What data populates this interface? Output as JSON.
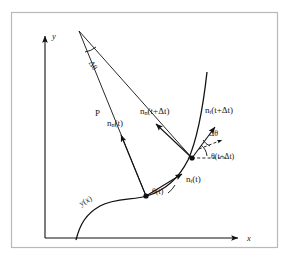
{
  "figure": {
    "type": "geometry-diagram",
    "background_color": "#ffffff",
    "ink_color": "#111111",
    "frame_color": "#b9b9bd"
  },
  "axes": {
    "x_label": "x",
    "y_label": "y",
    "origin": {
      "x": 45,
      "y": 238
    },
    "x_end": {
      "x": 243,
      "y": 238
    },
    "y_end": {
      "x": 45,
      "y": 32
    }
  },
  "curve": {
    "label": "y(x)",
    "label_rotation_deg": -30,
    "label_position": {
      "x": 80,
      "y": 205
    },
    "path": "M 76,240 C 80,224 86,214 100,206 C 114,198 134,200 147,196 C 163,191 178,180 188,160 C 198,138 203,108 207,72"
  },
  "points": [
    {
      "name": "point-t",
      "x": 146,
      "y": 196
    },
    {
      "name": "point-t-plus-dt",
      "x": 192,
      "y": 158
    }
  ],
  "vectors": [
    {
      "name": "normal-t",
      "label": "n",
      "subscript": "n",
      "argument": "(t)",
      "label_position": {
        "x": 113,
        "y": 123
      },
      "from": {
        "x": 146,
        "y": 196
      },
      "to": {
        "x": 119,
        "y": 133
      }
    },
    {
      "name": "normal-t-plus-dt",
      "label": "n",
      "subscript": "n",
      "argument": "(t+Δt)",
      "label_position": {
        "x": 148,
        "y": 110
      },
      "from": {
        "x": 192,
        "y": 158
      },
      "to": {
        "x": 154,
        "y": 122
      }
    },
    {
      "name": "tangent-t",
      "label": "n",
      "subscript": "t",
      "argument": "(t)",
      "label_position": {
        "x": 190,
        "y": 180
      },
      "from": {
        "x": 146,
        "y": 196
      },
      "to": {
        "x": 184,
        "y": 173
      }
    },
    {
      "name": "tangent-t-plus-dt",
      "label": "n",
      "subscript": "t",
      "argument": "(t+Δt)",
      "label_position": {
        "x": 212,
        "y": 110
      },
      "from": {
        "x": 192,
        "y": 158
      },
      "to": {
        "x": 217,
        "y": 125
      }
    }
  ],
  "angles": [
    {
      "name": "delta-theta-apex",
      "label": "Δθ",
      "rotation_deg": 58,
      "position": {
        "x": 93,
        "y": 62
      },
      "vertex": {
        "x": 79,
        "y": 31
      }
    },
    {
      "name": "delta-theta-tangents",
      "label": "Δθ",
      "rotation_deg": 0,
      "position": {
        "x": 218,
        "y": 133
      }
    },
    {
      "name": "theta-t",
      "label": "θ(t)",
      "position": {
        "x": 158,
        "y": 190
      }
    },
    {
      "name": "theta-t-plus-dt",
      "label": "θ(t+Δt)",
      "position": {
        "x": 213,
        "y": 155
      }
    }
  ],
  "radius": {
    "name": "radius-of-curvature",
    "label": "P",
    "label_position": {
      "x": 98,
      "y": 114
    },
    "apex": {
      "x": 79,
      "y": 31
    },
    "leg_a_end": {
      "x": 146,
      "y": 196
    },
    "leg_b_end": {
      "x": 192,
      "y": 158
    }
  }
}
